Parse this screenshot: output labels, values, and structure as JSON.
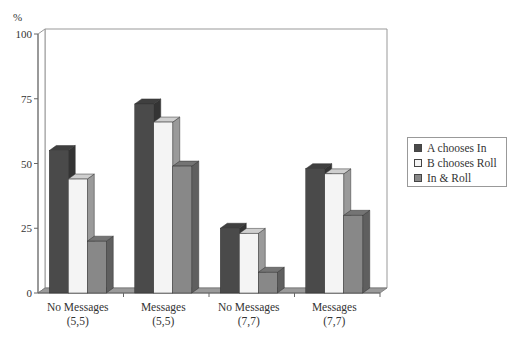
{
  "chart_data": {
    "type": "bar",
    "style": "3d-clustered-column",
    "title": "",
    "xlabel": "",
    "ylabel": "%",
    "ylim": [
      0,
      100
    ],
    "yticks": [
      0,
      25,
      50,
      75,
      100
    ],
    "grid": false,
    "legend_position": "right",
    "categories": [
      "No Messages\n(5,5)",
      "Messages\n(5,5)",
      "No Messages\n(7,7)",
      "Messages\n(7,7)"
    ],
    "category_lines": [
      [
        "No Messages",
        "(5,5)"
      ],
      [
        "Messages",
        "(5,5)"
      ],
      [
        "No Messages",
        "(7,7)"
      ],
      [
        "Messages",
        "(7,7)"
      ]
    ],
    "series": [
      {
        "name": "A chooses In",
        "color": "#4a4a4a",
        "values": [
          55,
          73,
          25,
          48
        ]
      },
      {
        "name": "B chooses Roll",
        "color": "#f4f4f4",
        "values": [
          44,
          66,
          23,
          46
        ]
      },
      {
        "name": "In & Roll",
        "color": "#888888",
        "values": [
          20,
          49,
          8,
          30
        ]
      }
    ]
  },
  "axis": {
    "y_unit": "%",
    "ticks": [
      "0",
      "25",
      "50",
      "75",
      "100"
    ]
  },
  "legend": {
    "items": [
      {
        "label": "A chooses In",
        "color": "#4a4a4a"
      },
      {
        "label": "B chooses Roll",
        "color": "#f4f4f4"
      },
      {
        "label": "In & Roll",
        "color": "#888888"
      }
    ]
  }
}
